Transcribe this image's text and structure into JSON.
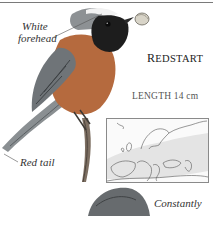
{
  "page": {
    "species_title_first": "R",
    "species_title_rest": "EDSTART",
    "length_label": "LENGTH 14 cm"
  },
  "annotations": {
    "forehead_line1": "White",
    "forehead_line2": "forehead",
    "tail": "Red tail",
    "second_bird_caption": "Constantly"
  },
  "map": {
    "region": "Europe",
    "range_color": "#e4e4e4",
    "border_color": "#8a8a8a"
  },
  "colors": {
    "rule": "#7a7a7a",
    "text": "#2b2b2b"
  }
}
